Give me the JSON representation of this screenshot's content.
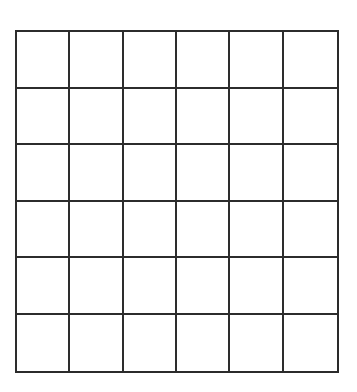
{
  "page": {
    "background_color": "#ffffff",
    "width": 357,
    "height": 392
  },
  "grid": {
    "kind": "blank-grid-worksheet",
    "columns": 6,
    "rows": 6,
    "cell_count": 36,
    "line_color": "#2c2c2c",
    "line_width_px": 2,
    "cell_fill_color": "#ffffff",
    "bounds": {
      "left": 15,
      "top": 30,
      "width": 324,
      "height": 343
    },
    "column_x_positions": [
      15,
      69,
      123,
      177,
      231,
      285,
      339
    ],
    "row_y_positions": [
      30,
      87,
      144,
      201,
      258,
      315,
      373
    ],
    "cells": [
      [
        "",
        "",
        "",
        "",
        "",
        ""
      ],
      [
        "",
        "",
        "",
        "",
        "",
        ""
      ],
      [
        "",
        "",
        "",
        "",
        "",
        ""
      ],
      [
        "",
        "",
        "",
        "",
        "",
        ""
      ],
      [
        "",
        "",
        "",
        "",
        "",
        ""
      ],
      [
        "",
        "",
        "",
        "",
        "",
        ""
      ]
    ]
  }
}
